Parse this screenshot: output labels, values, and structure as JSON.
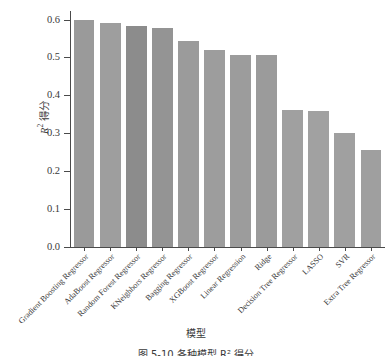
{
  "chart_data": {
    "type": "bar",
    "title": "",
    "xlabel": "模型",
    "ylabel": "R² 得分",
    "ylim": [
      0.0,
      0.62
    ],
    "ytick_labels": [
      "0.0",
      "0.1",
      "0.2",
      "0.3",
      "0.4",
      "0.5",
      "0.6"
    ],
    "ytick_values": [
      0.0,
      0.1,
      0.2,
      0.3,
      0.4,
      0.5,
      0.6
    ],
    "grid": false,
    "legend": false,
    "bar_color": "#9a9a9a",
    "categories": [
      "Gradient Boosting Regressor",
      "AdaBoost Regressor",
      "Random Forest Regressor",
      "KNeighbors Regressor",
      "Bagging Regressor",
      "XGBoost Regressor",
      "Linear Regression",
      "Ridge",
      "Decision Tree Regressor",
      "LASSO",
      "SVR",
      "Extra Tree Regressor"
    ],
    "values": [
      0.6,
      0.59,
      0.583,
      0.578,
      0.543,
      0.52,
      0.507,
      0.507,
      0.362,
      0.358,
      0.302,
      0.257
    ],
    "bar_colors": [
      "#9a9a9a",
      "#9e9e9e",
      "#8c8c8c",
      "#949494",
      "#9b9b9b",
      "#9d9d9d",
      "#9c9c9c",
      "#9b9b9b",
      "#a0a0a0",
      "#a1a1a1",
      "#a0a0a0",
      "#9f9f9f"
    ]
  },
  "axis": {
    "y_title_prefix": "R",
    "y_title_sup": "2",
    "y_title_suffix": " 得分",
    "x_title": "模型"
  },
  "caption": {
    "text": "图 5-10  各种模型 R² 得分"
  }
}
